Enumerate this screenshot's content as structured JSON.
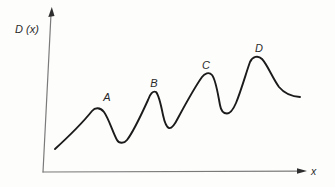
{
  "diagram": {
    "background_color": "#fdfdfc",
    "axes": {
      "color": "#7a7a7a",
      "arrowhead_color": "#2e2e2e",
      "y_label": "D (x)",
      "x_label": "x"
    },
    "curve": {
      "color": "#1b1b1b",
      "width": "1.9",
      "path": "M55,149 C67,138 84,121 92,111 C95,107.5 100,107 104,112 C109,119 113,133 117,140 C119,143.5 124,144 127,140 C134,131 142,113 148,100 C150,94 153,90.5 156,92 C159,95 161,105 163,115 C164.5,122 166,127 169,128 C172,129 175,124 178,118 C185,105 197,84 202,77 C204.5,73.5 209,71.5 212,75 C216,80 218,95 220,105 C221,111 224,113.5 227,113.5 C230,113.5 233,110 236,103 C241,91 247,70 250,62 C252.5,56.5 258,55 262,59 C267,64 272,77 279,87 C284,93 292,96.5 300,97"
    },
    "peaks": [
      {
        "label": "A",
        "x": "107",
        "y": "101"
      },
      {
        "label": "B",
        "x": "154",
        "y": "87"
      },
      {
        "label": "C",
        "x": "206",
        "y": "69"
      },
      {
        "label": "D",
        "x": "259",
        "y": "52"
      }
    ]
  }
}
